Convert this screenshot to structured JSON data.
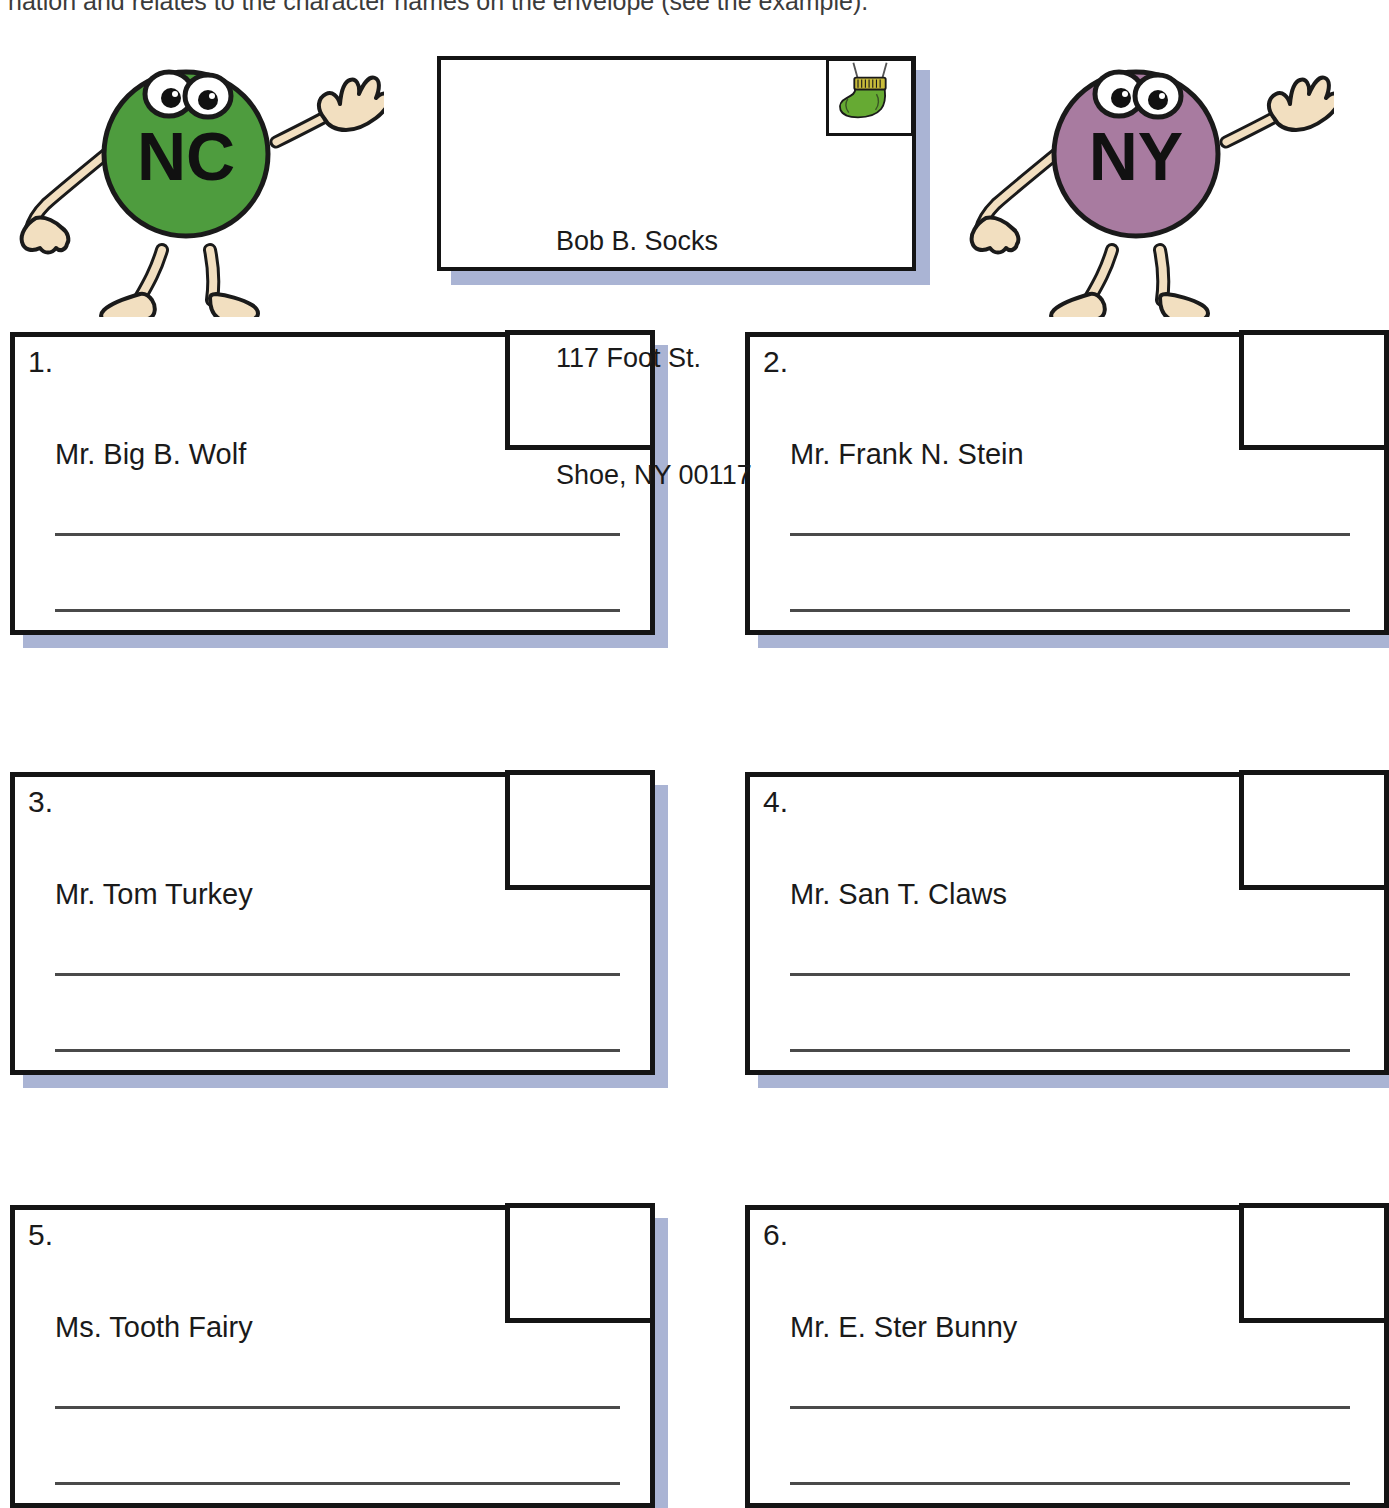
{
  "instruction": {
    "text": "nation and relates to the character names on the envelope (see the example)."
  },
  "mascots": [
    {
      "label": "NC",
      "body_color": "#4e9c3e",
      "limb_color": "#f2dfc0",
      "outline_color": "#1a1a1a"
    },
    {
      "label": "NY",
      "body_color": "#a87ba0",
      "limb_color": "#f2dfc0",
      "outline_color": "#1a1a1a"
    }
  ],
  "example_envelope": {
    "stamp_icon": "sock-stamp-icon",
    "stamp_sock_color": "#66aa33",
    "stamp_cuff_color": "#c8bb3a",
    "address_lines": [
      "Bob B. Socks",
      "117 Foot St.",
      "Shoe, NY 00117"
    ]
  },
  "envelopes": [
    {
      "number": "1.",
      "name": "Mr. Big B. Wolf",
      "stamp_icon": "empty-stamp-box"
    },
    {
      "number": "2.",
      "name": "Mr. Frank N. Stein",
      "stamp_icon": "empty-stamp-box"
    },
    {
      "number": "3.",
      "name": "Mr. Tom Turkey",
      "stamp_icon": "empty-stamp-box"
    },
    {
      "number": "4.",
      "name": "Mr. San T. Claws",
      "stamp_icon": "empty-stamp-box"
    },
    {
      "number": "5.",
      "name": "Ms. Tooth Fairy",
      "stamp_icon": "empty-stamp-box"
    },
    {
      "number": "6.",
      "name": "Mr. E. Ster Bunny",
      "stamp_icon": "empty-stamp-box"
    }
  ],
  "colors": {
    "shadow": "#aab4d4",
    "ink": "#141414",
    "rule_line": "#4a4a4a"
  }
}
